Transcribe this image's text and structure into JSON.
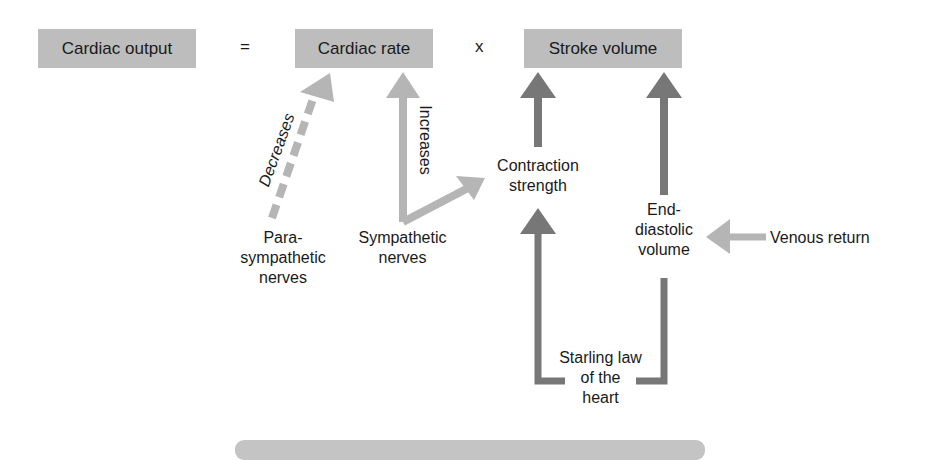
{
  "equation": {
    "result": "Cardiac output",
    "equals": "=",
    "factor1": "Cardiac rate",
    "times": "x",
    "factor2": "Stroke volume"
  },
  "influences": {
    "parasympathetic": {
      "label_lines": [
        "Para-",
        "sympathetic",
        "nerves"
      ],
      "arrow_label": "Decreases",
      "target": "Cardiac rate",
      "style": "dashed-light"
    },
    "sympathetic": {
      "label_lines": [
        "Sympathetic",
        "nerves"
      ],
      "arrow_label": "Increases",
      "targets": [
        "Cardiac rate",
        "Contraction strength"
      ],
      "style": "solid-light"
    },
    "contraction": {
      "label_lines": [
        "Contraction",
        "strength"
      ],
      "target": "Stroke volume",
      "style": "solid-dark"
    },
    "edv": {
      "label_lines": [
        "End-",
        "diastolic",
        "volume"
      ],
      "target": "Stroke volume",
      "style": "solid-dark"
    },
    "venous": {
      "label": "Venous return",
      "target": "End-diastolic volume",
      "style": "solid-light"
    },
    "starling": {
      "label_lines": [
        "Starling law",
        "of the",
        "heart"
      ],
      "link": [
        "End-diastolic volume",
        "Contraction strength"
      ],
      "style": "solid-dark"
    }
  },
  "colors": {
    "box_fill": "#bdbdbd",
    "light_arrow": "#b5b5b5",
    "dark_arrow": "#777777",
    "text": "#1a1a1a"
  }
}
